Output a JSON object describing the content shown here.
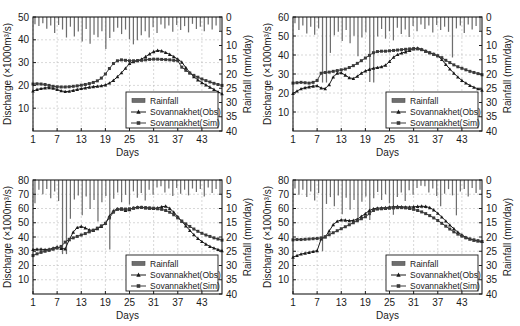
{
  "figure": {
    "panel_count": 4,
    "shared": {
      "xlabel": "Days",
      "ylabel_left": "Discharge (×1000m³/s)",
      "ylabel_right": "Rainfall (mm/day)",
      "xticks": [
        1,
        7,
        13,
        19,
        25,
        31,
        37,
        43
      ],
      "xlim": [
        1,
        48
      ],
      "right_ticks": [
        0,
        5,
        10,
        15,
        20,
        25,
        30,
        35,
        40
      ],
      "right_lim": [
        0,
        40
      ],
      "legend": [
        {
          "label": "Rainfall",
          "marker": "bar",
          "color": "#6e6e6e"
        },
        {
          "label": "Sovannakhet(Obs)",
          "marker": "triangle",
          "color": "#1a1a1a"
        },
        {
          "label": "Sovannakhet(Sim)",
          "marker": "square",
          "color": "#3a3a3a"
        }
      ]
    }
  },
  "chart_data": [
    {
      "type": "line",
      "id": "panel-1",
      "title": "",
      "xlabel": "Days",
      "ylabel": "Discharge (×1000m³/s)",
      "y2label": "Rainfall (mm/day)",
      "xlim": [
        1,
        48
      ],
      "ylim": [
        0,
        50
      ],
      "yticks": [
        10,
        20,
        30,
        40,
        50
      ],
      "y2lim": [
        0,
        40
      ],
      "y2ticks": [
        0,
        5,
        10,
        15,
        20,
        25,
        30,
        35,
        40
      ],
      "grid": true,
      "legend_position": "lower-right",
      "x": [
        1,
        2,
        3,
        4,
        5,
        6,
        7,
        8,
        9,
        10,
        11,
        12,
        13,
        14,
        15,
        16,
        17,
        18,
        19,
        20,
        21,
        22,
        23,
        24,
        25,
        26,
        27,
        28,
        29,
        30,
        31,
        32,
        33,
        34,
        35,
        36,
        37,
        38,
        39,
        40,
        41,
        42,
        43,
        44,
        45,
        46,
        47,
        48
      ],
      "series": [
        {
          "name": "Sovannakhet(Obs)",
          "marker": "triangle",
          "values": [
            17.5,
            18.2,
            18.6,
            18.9,
            19.0,
            18.7,
            18.2,
            17.6,
            17.3,
            17.4,
            17.8,
            18.2,
            18.6,
            18.9,
            19.2,
            19.4,
            19.6,
            19.8,
            20.2,
            21.0,
            22.2,
            23.8,
            25.5,
            27.5,
            29.6,
            30.4,
            30.8,
            31.5,
            32.6,
            33.8,
            34.8,
            35.3,
            35.1,
            34.4,
            33.6,
            32.6,
            31.5,
            30.2,
            27.8,
            25.6,
            23.8,
            22.4,
            21.2,
            20.2,
            19.2,
            18.2,
            17.2,
            16.3
          ]
        },
        {
          "name": "Sovannakhet(Sim)",
          "marker": "square",
          "values": [
            20.6,
            20.7,
            20.6,
            20.4,
            20.0,
            19.6,
            19.4,
            19.3,
            19.3,
            19.4,
            19.6,
            19.8,
            20.1,
            20.4,
            20.8,
            21.3,
            22.0,
            23.2,
            25.0,
            27.4,
            29.6,
            30.8,
            31.2,
            31.0,
            30.8,
            30.8,
            30.9,
            31.0,
            31.2,
            31.4,
            31.5,
            31.5,
            31.4,
            31.3,
            31.2,
            31.0,
            30.8,
            28.0,
            26.6,
            25.4,
            24.4,
            23.6,
            22.8,
            22.1,
            21.5,
            20.9,
            20.4,
            20.0
          ]
        }
      ],
      "rainfall": {
        "name": "Rainfall",
        "unit": "mm/day",
        "values": [
          2.5,
          3.2,
          2.2,
          4.1,
          3.0,
          5.6,
          2.8,
          4.4,
          7.2,
          3.4,
          6.8,
          5.1,
          8.6,
          4.2,
          9.4,
          6.2,
          7.1,
          5.0,
          11.2,
          7.4,
          5.2,
          3.8,
          6.0,
          4.4,
          7.8,
          9.6,
          8.2,
          6.4,
          5.0,
          7.2,
          3.6,
          5.6,
          2.6,
          4.0,
          3.0,
          5.2,
          2.8,
          4.6,
          3.2,
          5.4,
          2.4,
          4.2,
          3.4,
          5.0,
          2.6,
          4.4,
          3.0,
          4.8
        ]
      }
    },
    {
      "type": "line",
      "id": "panel-2",
      "title": "",
      "xlabel": "Days",
      "ylabel": "Discharge (×1000m³/s)",
      "y2label": "Rainfall (mm/day)",
      "xlim": [
        1,
        48
      ],
      "ylim": [
        0,
        60
      ],
      "yticks": [
        10,
        20,
        30,
        40,
        50,
        60
      ],
      "y2lim": [
        0,
        40
      ],
      "y2ticks": [
        0,
        5,
        10,
        15,
        20,
        25,
        30,
        35,
        40
      ],
      "grid": true,
      "legend_position": "lower-right",
      "x": [
        1,
        2,
        3,
        4,
        5,
        6,
        7,
        8,
        9,
        10,
        11,
        12,
        13,
        14,
        15,
        16,
        17,
        18,
        19,
        20,
        21,
        22,
        23,
        24,
        25,
        26,
        27,
        28,
        29,
        30,
        31,
        32,
        33,
        34,
        35,
        36,
        37,
        38,
        39,
        40,
        41,
        42,
        43,
        44,
        45,
        46,
        47,
        48
      ],
      "series": [
        {
          "name": "Sovannakhet(Obs)",
          "marker": "triangle",
          "values": [
            19.8,
            21.0,
            22.2,
            22.8,
            23.2,
            23.6,
            23.8,
            22.6,
            22.3,
            24.4,
            28.4,
            30.4,
            30.6,
            29.4,
            28.0,
            27.6,
            28.8,
            30.4,
            31.6,
            32.4,
            33.0,
            33.4,
            33.8,
            34.6,
            36.6,
            38.8,
            40.2,
            41.0,
            41.6,
            42.4,
            43.2,
            43.6,
            43.0,
            42.0,
            41.2,
            40.4,
            39.6,
            37.6,
            35.0,
            32.6,
            30.4,
            28.4,
            26.6,
            25.2,
            24.0,
            23.0,
            22.2,
            21.4
          ]
        },
        {
          "name": "Sovannakhet(Sim)",
          "marker": "square",
          "values": [
            25.2,
            25.4,
            25.6,
            25.4,
            25.2,
            25.6,
            26.6,
            30.4,
            30.8,
            31.0,
            31.4,
            31.8,
            32.2,
            32.6,
            33.4,
            34.4,
            35.6,
            37.0,
            38.4,
            39.8,
            41.2,
            41.8,
            42.0,
            42.0,
            42.2,
            42.4,
            42.6,
            42.8,
            43.0,
            43.2,
            43.4,
            43.2,
            42.8,
            42.0,
            41.2,
            40.4,
            39.6,
            38.6,
            37.2,
            36.0,
            34.8,
            33.8,
            33.0,
            32.2,
            31.4,
            30.8,
            30.2,
            29.6
          ]
        }
      ],
      "rainfall": {
        "name": "Rainfall",
        "unit": "mm/day",
        "values": [
          2.2,
          4.6,
          3.0,
          5.8,
          3.4,
          6.2,
          4.0,
          23.0,
          23.0,
          12.6,
          6.4,
          5.2,
          8.4,
          4.6,
          9.2,
          6.6,
          13.8,
          7.2,
          5.4,
          22.8,
          23.0,
          6.8,
          4.2,
          7.6,
          5.0,
          8.2,
          3.8,
          6.0,
          4.4,
          7.0,
          3.2,
          5.0,
          2.6,
          4.2,
          3.0,
          5.4,
          2.8,
          4.6,
          3.4,
          5.2,
          14.2,
          4.0,
          3.0,
          5.6,
          2.6,
          4.4,
          3.2,
          4.8
        ]
      }
    },
    {
      "type": "line",
      "id": "panel-3",
      "title": "",
      "xlabel": "Days",
      "ylabel": "Discharge (×1000m³/s)",
      "y2label": "Rainfall (mm/day)",
      "xlim": [
        1,
        48
      ],
      "ylim": [
        0,
        80
      ],
      "yticks": [
        10,
        20,
        30,
        40,
        50,
        60,
        70,
        80
      ],
      "y2lim": [
        0,
        40
      ],
      "y2ticks": [
        0,
        5,
        10,
        15,
        20,
        25,
        30,
        35,
        40
      ],
      "grid": true,
      "legend_position": "lower-right",
      "x": [
        1,
        2,
        3,
        4,
        5,
        6,
        7,
        8,
        9,
        10,
        11,
        12,
        13,
        14,
        15,
        16,
        17,
        18,
        19,
        20,
        21,
        22,
        23,
        24,
        25,
        26,
        27,
        28,
        29,
        30,
        31,
        32,
        33,
        34,
        35,
        36,
        37,
        38,
        39,
        40,
        41,
        42,
        43,
        44,
        45,
        46,
        47,
        48
      ],
      "series": [
        {
          "name": "Sovannakhet(Obs)",
          "marker": "triangle",
          "values": [
            31.2,
            31.4,
            31.4,
            31.2,
            31.4,
            32.2,
            33.0,
            32.0,
            31.6,
            38.0,
            43.4,
            46.6,
            47.4,
            46.4,
            45.0,
            44.6,
            45.8,
            47.4,
            49.6,
            54.6,
            58.4,
            59.8,
            59.4,
            58.6,
            59.2,
            60.4,
            61.0,
            60.8,
            60.4,
            60.2,
            60.0,
            60.4,
            61.2,
            61.6,
            60.0,
            57.4,
            54.2,
            51.0,
            47.8,
            44.6,
            41.6,
            39.0,
            36.8,
            35.0,
            33.4,
            32.2,
            31.2,
            30.4
          ]
        },
        {
          "name": "Sovannakhet(Sim)",
          "marker": "square",
          "values": [
            27.0,
            28.2,
            29.2,
            30.0,
            30.6,
            31.4,
            32.2,
            33.4,
            36.4,
            38.4,
            39.4,
            40.4,
            41.4,
            42.4,
            43.6,
            44.8,
            46.2,
            47.8,
            49.6,
            53.4,
            57.4,
            59.4,
            59.8,
            59.6,
            59.8,
            60.2,
            60.6,
            60.8,
            60.6,
            60.4,
            60.2,
            59.8,
            59.4,
            58.6,
            57.4,
            55.6,
            53.4,
            51.2,
            49.2,
            47.4,
            45.6,
            44.0,
            42.6,
            41.4,
            40.4,
            39.4,
            38.6,
            37.8
          ]
        }
      ],
      "rainfall": {
        "name": "Rainfall",
        "unit": "mm/day",
        "values": [
          8.2,
          3.4,
          5.0,
          3.2,
          6.4,
          4.0,
          7.4,
          26.0,
          26.0,
          13.6,
          6.8,
          5.4,
          12.4,
          5.8,
          10.2,
          7.0,
          14.6,
          7.8,
          5.6,
          24.4,
          6.6,
          4.4,
          7.8,
          5.2,
          8.6,
          4.0,
          6.2,
          4.6,
          7.2,
          3.4,
          5.2,
          2.6,
          2.2,
          4.4,
          3.0,
          5.6,
          2.8,
          4.8,
          3.4,
          5.4,
          3.0,
          4.2,
          3.2,
          5.8,
          2.6,
          4.6,
          3.2,
          5.0
        ]
      }
    },
    {
      "type": "line",
      "id": "panel-4",
      "title": "",
      "xlabel": "Days",
      "ylabel": "Discharge (×1000m³/s)",
      "y2label": "Rainfall (mm/day)",
      "xlim": [
        1,
        48
      ],
      "ylim": [
        0,
        80
      ],
      "yticks": [
        10,
        20,
        30,
        40,
        50,
        60,
        70,
        80
      ],
      "y2lim": [
        0,
        40
      ],
      "y2ticks": [
        0,
        5,
        10,
        15,
        20,
        25,
        30,
        35,
        40
      ],
      "grid": true,
      "legend_position": "lower-right",
      "x": [
        1,
        2,
        3,
        4,
        5,
        6,
        7,
        8,
        9,
        10,
        11,
        12,
        13,
        14,
        15,
        16,
        17,
        18,
        19,
        20,
        21,
        22,
        23,
        24,
        25,
        26,
        27,
        28,
        29,
        30,
        31,
        32,
        33,
        34,
        35,
        36,
        37,
        38,
        39,
        40,
        41,
        42,
        43,
        44,
        45,
        46,
        47,
        48
      ],
      "series": [
        {
          "name": "Sovannakhet(Obs)",
          "marker": "triangle",
          "values": [
            25.8,
            27.0,
            28.0,
            28.6,
            29.2,
            29.8,
            30.4,
            38.6,
            40.0,
            44.2,
            48.6,
            51.0,
            52.0,
            51.8,
            51.4,
            51.6,
            52.6,
            54.4,
            56.4,
            58.6,
            59.8,
            60.2,
            60.4,
            60.6,
            61.0,
            61.2,
            61.4,
            61.2,
            61.0,
            61.0,
            61.2,
            61.4,
            61.6,
            61.4,
            60.6,
            59.0,
            56.6,
            54.0,
            51.2,
            48.4,
            45.8,
            43.4,
            41.4,
            39.8,
            38.6,
            37.8,
            37.2,
            36.8
          ]
        },
        {
          "name": "Sovannakhet(Sim)",
          "marker": "square",
          "values": [
            38.0,
            38.2,
            38.2,
            38.4,
            38.6,
            38.8,
            39.0,
            39.4,
            40.2,
            41.6,
            43.0,
            44.4,
            45.8,
            47.2,
            48.6,
            50.0,
            51.4,
            52.8,
            54.2,
            56.4,
            58.6,
            59.6,
            59.8,
            60.0,
            60.2,
            60.4,
            60.6,
            60.6,
            60.4,
            60.0,
            59.4,
            58.6,
            57.6,
            56.4,
            55.0,
            53.4,
            51.6,
            49.6,
            47.6,
            45.6,
            43.6,
            42.0,
            40.6,
            39.4,
            38.6,
            38.0,
            37.4,
            36.8
          ]
        }
      ],
      "rainfall": {
        "name": "Rainfall",
        "unit": "mm/day",
        "values": [
          3.0,
          5.2,
          3.4,
          6.0,
          4.0,
          7.2,
          4.6,
          25.0,
          8.4,
          6.0,
          9.2,
          5.4,
          12.0,
          6.2,
          10.4,
          7.0,
          13.2,
          7.6,
          5.8,
          14.0,
          6.4,
          4.2,
          7.0,
          5.0,
          8.2,
          12.2,
          6.0,
          4.4,
          7.4,
          3.6,
          5.2,
          2.8,
          2.0,
          2.2,
          4.4,
          3.0,
          5.6,
          9.2,
          4.8,
          3.2,
          5.4,
          12.4,
          4.0,
          3.2,
          5.8,
          2.8,
          4.6,
          3.4
        ]
      }
    }
  ]
}
